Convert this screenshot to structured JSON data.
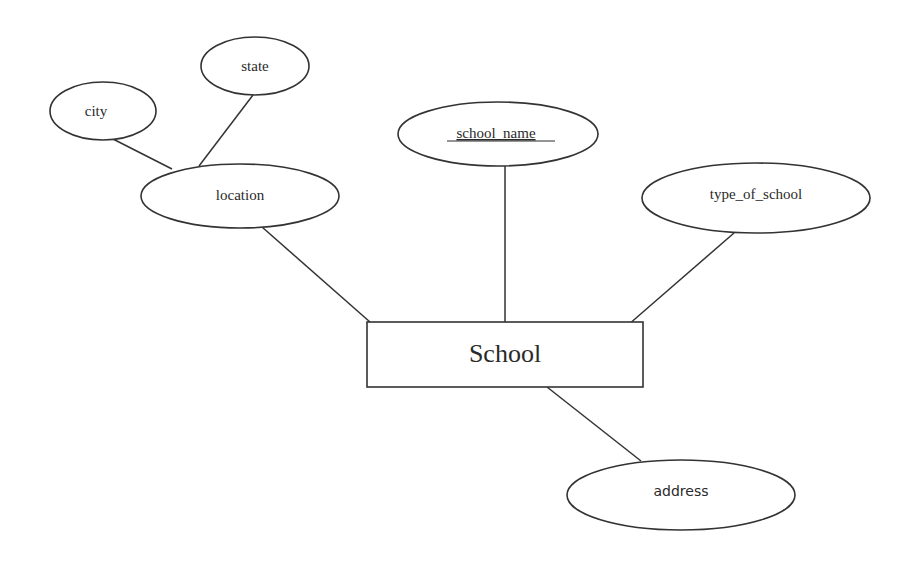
{
  "diagram": {
    "type": "ER diagram",
    "entity": {
      "id": "school",
      "label": "School",
      "x": 367,
      "y": 322,
      "w": 276,
      "h": 65
    },
    "attributes": [
      {
        "id": "state",
        "label": "state",
        "cx": 255,
        "cy": 66,
        "rx": 54,
        "ry": 29,
        "key": false
      },
      {
        "id": "city",
        "label": "city",
        "cx": 103,
        "cy": 111,
        "rx": 53,
        "ry": 29,
        "key": false
      },
      {
        "id": "location",
        "label": "location",
        "cx": 240,
        "cy": 196,
        "rx": 99,
        "ry": 32,
        "key": false,
        "composite": true
      },
      {
        "id": "school_name",
        "label": "school_name",
        "cx": 498,
        "cy": 134,
        "rx": 100,
        "ry": 32,
        "key": true
      },
      {
        "id": "type_of_school",
        "label": "type_of_school",
        "cx": 756,
        "cy": 198,
        "rx": 114,
        "ry": 35,
        "key": false
      },
      {
        "id": "address",
        "label": "address",
        "cx": 681,
        "cy": 495,
        "rx": 114,
        "ry": 35,
        "key": false
      }
    ],
    "edges": [
      {
        "from": "city",
        "to": "location"
      },
      {
        "from": "state",
        "to": "location"
      },
      {
        "from": "location",
        "to": "School"
      },
      {
        "from": "school_name",
        "to": "School"
      },
      {
        "from": "type_of_school",
        "to": "School"
      },
      {
        "from": "School",
        "to": "address"
      }
    ],
    "colors": {
      "stroke": "#333333",
      "background": "#ffffff",
      "text": "#2a2a2a"
    }
  }
}
